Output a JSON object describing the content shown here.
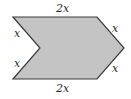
{
  "diagram": {
    "shape": "chevron-hexagon",
    "fill_color": "#c4c4c4",
    "stroke_color": "#3a3a3a",
    "vertices": [
      [
        13,
        17
      ],
      [
        97,
        17
      ],
      [
        124,
        48
      ],
      [
        97,
        79
      ],
      [
        13,
        79
      ],
      [
        40,
        48
      ]
    ],
    "labels": {
      "top": "2x",
      "bottom": "2x",
      "left_upper": "x",
      "left_lower": "x",
      "right_upper": "x",
      "right_lower": "x"
    }
  }
}
